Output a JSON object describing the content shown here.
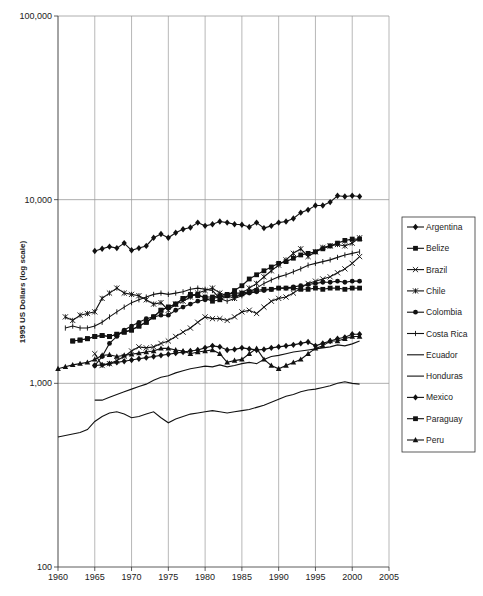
{
  "chart_data": {
    "type": "line",
    "title": "",
    "xlabel": "",
    "ylabel": "1995 US Dollars (log scale)",
    "yscale": "log",
    "ylim": [
      100,
      100000
    ],
    "xlim": [
      1960,
      2005
    ],
    "x_ticks": [
      "1960",
      "1965",
      "1970",
      "1975",
      "1980",
      "1985",
      "1990",
      "1995",
      "2000",
      "2005"
    ],
    "y_ticks": [
      "100",
      "1,000",
      "10,000",
      "100,000"
    ],
    "grid": true,
    "legend_position": "right",
    "series": [
      {
        "name": "Argentina",
        "marker": "diamond",
        "start": 1965,
        "values": [
          5250,
          5400,
          5550,
          5450,
          5800,
          5300,
          5450,
          5600,
          6200,
          6500,
          6200,
          6600,
          6900,
          7050,
          7500,
          7200,
          7350,
          7600,
          7500,
          7350,
          7300,
          7100,
          7500,
          7000,
          7200,
          7500,
          7600,
          7900,
          8500,
          8800,
          9300,
          9300,
          9700,
          10500,
          10400,
          10500,
          10400
        ]
      },
      {
        "name": "Belize",
        "marker": "square",
        "start": 1962,
        "values": [
          1700,
          1720,
          1750,
          1800,
          1820,
          1800,
          1850,
          1900,
          1950,
          2050,
          2150,
          2300,
          2500,
          2600,
          2700,
          2900,
          3000,
          3050,
          2900,
          2800,
          2850,
          3000,
          3200,
          3400,
          3700,
          3900,
          4100,
          4300,
          4500,
          4600,
          4800,
          5000,
          5100,
          5200,
          5400,
          5600,
          5800,
          6000,
          6100,
          6100
        ]
      },
      {
        "name": "Brazil",
        "marker": "x",
        "start": 1965,
        "values": [
          1450,
          1250,
          1280,
          1330,
          1400,
          1500,
          1580,
          1560,
          1580,
          1650,
          1700,
          1800,
          1900,
          2000,
          2150,
          2300,
          2250,
          2250,
          2200,
          2300,
          2450,
          2500,
          2400,
          2600,
          2800,
          2900,
          2950,
          3100,
          3300,
          3500,
          3600,
          3700,
          3800,
          4000,
          4200,
          4500,
          4900
        ]
      },
      {
        "name": "Chile",
        "marker": "asterisk",
        "start": 1961,
        "values": [
          2300,
          2200,
          2350,
          2400,
          2450,
          2900,
          3100,
          3300,
          3100,
          3050,
          3000,
          2850,
          2700,
          2750,
          2500,
          2700,
          2800,
          2950,
          3100,
          3200,
          3300,
          3100,
          3000,
          2900,
          3100,
          3300,
          3500,
          3800,
          4100,
          4400,
          4700,
          5100,
          5400,
          4900,
          5200,
          5500,
          5600,
          5700,
          5600,
          5800,
          6200
        ]
      },
      {
        "name": "Colombia",
        "marker": "circle",
        "start": 1965,
        "values": [
          1250,
          1400,
          1650,
          1800,
          1950,
          2050,
          2150,
          2250,
          2300,
          2350,
          2350,
          2500,
          2600,
          2700,
          2800,
          2850,
          2900,
          2950,
          3000,
          3000,
          3050,
          3100,
          3150,
          3200,
          3250,
          3300,
          3300,
          3350,
          3400,
          3450,
          3500,
          3550,
          3550,
          3600,
          3550,
          3600,
          3600
        ]
      },
      {
        "name": "Costa Rica",
        "marker": "plus",
        "start": 1961,
        "values": [
          2000,
          2050,
          2000,
          2000,
          2050,
          2150,
          2300,
          2450,
          2600,
          2750,
          2850,
          2950,
          3050,
          3100,
          3050,
          3100,
          3150,
          3250,
          3300,
          3250,
          3200,
          2900,
          2800,
          2900,
          3000,
          3150,
          3300,
          3500,
          3650,
          3800,
          3900,
          4050,
          4200,
          4400,
          4500,
          4600,
          4700,
          4850,
          5000,
          5100,
          5200
        ]
      },
      {
        "name": "Ecuador",
        "marker": "none",
        "start": 1965,
        "values": [
          810,
          810,
          840,
          870,
          900,
          930,
          960,
          990,
          1040,
          1080,
          1100,
          1140,
          1170,
          1200,
          1220,
          1240,
          1230,
          1260,
          1230,
          1250,
          1280,
          1300,
          1280,
          1350,
          1400,
          1420,
          1450,
          1480,
          1500,
          1520,
          1540,
          1560,
          1580,
          1620,
          1600,
          1640,
          1700
        ]
      },
      {
        "name": "Honduras",
        "marker": "none",
        "start": 1960,
        "values": [
          510,
          520,
          530,
          540,
          560,
          620,
          660,
          690,
          700,
          680,
          650,
          660,
          680,
          700,
          650,
          610,
          640,
          660,
          680,
          690,
          700,
          710,
          700,
          690,
          700,
          710,
          720,
          740,
          760,
          790,
          820,
          850,
          870,
          900,
          920,
          930,
          950,
          970,
          1000,
          1020,
          1000,
          990
        ]
      },
      {
        "name": "Mexico",
        "marker": "diamond",
        "start": 1965,
        "values": [
          1250,
          1260,
          1280,
          1300,
          1320,
          1340,
          1360,
          1380,
          1400,
          1420,
          1440,
          1460,
          1480,
          1500,
          1520,
          1560,
          1600,
          1580,
          1520,
          1530,
          1560,
          1540,
          1520,
          1530,
          1560,
          1580,
          1600,
          1620,
          1650,
          1680,
          1600,
          1650,
          1700,
          1750,
          1780,
          1850,
          1850
        ]
      },
      {
        "name": "Paraguay",
        "marker": "square",
        "start": 1962,
        "values": [
          1700,
          1720,
          1750,
          1800,
          1820,
          1800,
          1850,
          1900,
          1950,
          2050,
          2150,
          2300,
          2500,
          2600,
          2700,
          2900,
          3050,
          3000,
          2950,
          2950,
          3000,
          3050,
          3100,
          3100,
          3150,
          3200,
          3250,
          3250,
          3300,
          3300,
          3300,
          3250,
          3250,
          3300,
          3250,
          3300,
          3300,
          3250,
          3300,
          3300
        ]
      },
      {
        "name": "Peru",
        "marker": "triangle",
        "start": 1960,
        "values": [
          1200,
          1230,
          1260,
          1280,
          1300,
          1350,
          1420,
          1430,
          1400,
          1420,
          1440,
          1460,
          1480,
          1500,
          1550,
          1550,
          1520,
          1500,
          1450,
          1480,
          1500,
          1520,
          1450,
          1300,
          1330,
          1350,
          1450,
          1550,
          1350,
          1250,
          1200,
          1250,
          1300,
          1350,
          1450,
          1550,
          1600,
          1700,
          1700,
          1750,
          1800,
          1800
        ]
      }
    ]
  },
  "legend": {
    "items": [
      {
        "label": "Argentina",
        "marker": "diamond"
      },
      {
        "label": "Belize",
        "marker": "square"
      },
      {
        "label": "Brazil",
        "marker": "x"
      },
      {
        "label": "Chile",
        "marker": "asterisk"
      },
      {
        "label": "Colombia",
        "marker": "circle"
      },
      {
        "label": "Costa Rica",
        "marker": "plus"
      },
      {
        "label": "Ecuador",
        "marker": "none"
      },
      {
        "label": "Honduras",
        "marker": "none"
      },
      {
        "label": "Mexico",
        "marker": "diamond"
      },
      {
        "label": "Paraguay",
        "marker": "square"
      },
      {
        "label": "Peru",
        "marker": "triangle"
      }
    ]
  },
  "colors": {
    "line": "#111111",
    "grid": "#999999",
    "background": "#ffffff"
  }
}
